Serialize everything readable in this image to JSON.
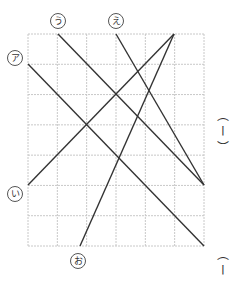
{
  "diagram": {
    "grid": {
      "left": 28,
      "top": 34,
      "right": 204,
      "bottom": 246,
      "cols": 6,
      "rows": 7,
      "color": "#c8c8c8"
    },
    "line_color": "#333333",
    "lines": [
      {
        "id": "a",
        "label": "ア",
        "x1": 28,
        "y1": 64,
        "x2": 204,
        "y2": 246
      },
      {
        "id": "i",
        "label": "い",
        "x1": 28,
        "y1": 185,
        "x2": 174,
        "y2": 34
      },
      {
        "id": "u",
        "label": "う",
        "x1": 58,
        "y1": 34,
        "x2": 204,
        "y2": 185
      },
      {
        "id": "e",
        "label": "え",
        "x1": 116,
        "y1": 34,
        "x2": 204,
        "y2": 185
      },
      {
        "id": "o",
        "label": "お",
        "x1": 80,
        "y1": 246,
        "x2": 174,
        "y2": 34
      }
    ],
    "labels": [
      {
        "text": "ア",
        "x": 7,
        "y": 50
      },
      {
        "text": "う",
        "x": 50,
        "y": 13
      },
      {
        "text": "え",
        "x": 108,
        "y": 13
      },
      {
        "text": "い",
        "x": 7,
        "y": 186
      },
      {
        "text": "お",
        "x": 70,
        "y": 253
      }
    ]
  },
  "side_text": {
    "top": "︵ ー ︶",
    "bottom": "︵ ー"
  }
}
